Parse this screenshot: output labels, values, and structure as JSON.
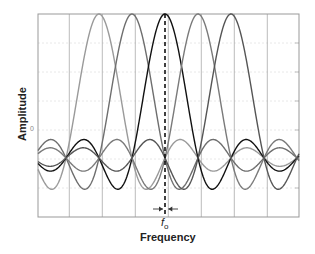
{
  "chart_data": {
    "type": "line",
    "title": "",
    "xlabel": "Frequency",
    "ylabel": "Amplitude",
    "x_annotation": "f0",
    "x_annotation_main": "f",
    "x_annotation_sub": "o",
    "yticks": [
      "0"
    ],
    "grid": true,
    "xlim": [
      -3.85,
      4.0
    ],
    "ylim": [
      -0.4,
      1.0
    ],
    "function": "sinc",
    "series": [
      {
        "name": "subcarrier -2",
        "center": -2,
        "color": "#9a9a9a"
      },
      {
        "name": "subcarrier -1",
        "center": -1,
        "color": "#6e6e6e"
      },
      {
        "name": "subcarrier 0 (f0)",
        "center": 0,
        "color": "#111111"
      },
      {
        "name": "subcarrier 1",
        "center": 1,
        "color": "#7a7a7a"
      },
      {
        "name": "subcarrier 2",
        "center": 2,
        "color": "#555555"
      }
    ],
    "marker": {
      "type": "dashed-vertical",
      "x": 0,
      "label": "f0"
    },
    "spacing_arrows": {
      "from": -0.1,
      "to": 0.1
    }
  },
  "labels": {
    "ylabel": "Amplitude",
    "xlabel": "Frequency",
    "f_main": "f",
    "f_sub": "o",
    "zero_tick": "0"
  }
}
